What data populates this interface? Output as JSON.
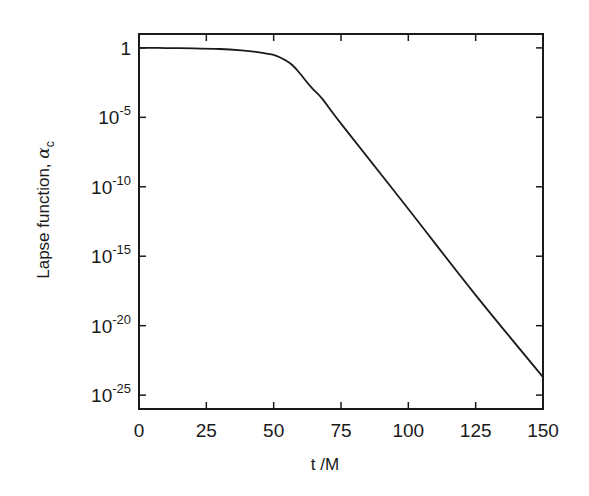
{
  "chart_data": {
    "type": "line",
    "title": "",
    "xlabel": "t /M",
    "ylabel": "Lapse function, αc",
    "ylabel_main": "Lapse function, ",
    "ylabel_symbol": "α",
    "ylabel_subscript": "c",
    "xscale": "linear",
    "yscale": "log",
    "xlim": [
      0,
      150
    ],
    "ylim": [
      1e-26,
      10
    ],
    "grid": false,
    "legend": null,
    "x_ticks": [
      0,
      25,
      50,
      75,
      100,
      125,
      150
    ],
    "x_tick_labels": [
      "0",
      "25",
      "50",
      "75",
      "100",
      "125",
      "150"
    ],
    "y_ticks_log10": [
      0,
      -5,
      -10,
      -15,
      -20,
      -25
    ],
    "y_tick_labels": [
      {
        "base": "1",
        "exp": ""
      },
      {
        "base": "10",
        "exp": "-5"
      },
      {
        "base": "10",
        "exp": "-10"
      },
      {
        "base": "10",
        "exp": "-15"
      },
      {
        "base": "10",
        "exp": "-20"
      },
      {
        "base": "10",
        "exp": "-25"
      }
    ],
    "series": [
      {
        "name": "lapse at center",
        "color": "#1a1a1a",
        "x": [
          0,
          10,
          20,
          30,
          38,
          44,
          48,
          51,
          54,
          57,
          60,
          64,
          68,
          75,
          100,
          125,
          150
        ],
        "log10_y": [
          0.0,
          -0.01,
          -0.03,
          -0.08,
          -0.18,
          -0.3,
          -0.43,
          -0.57,
          -0.85,
          -1.25,
          -1.9,
          -2.85,
          -3.65,
          -5.45,
          -11.6,
          -17.8,
          -23.7
        ]
      }
    ]
  }
}
